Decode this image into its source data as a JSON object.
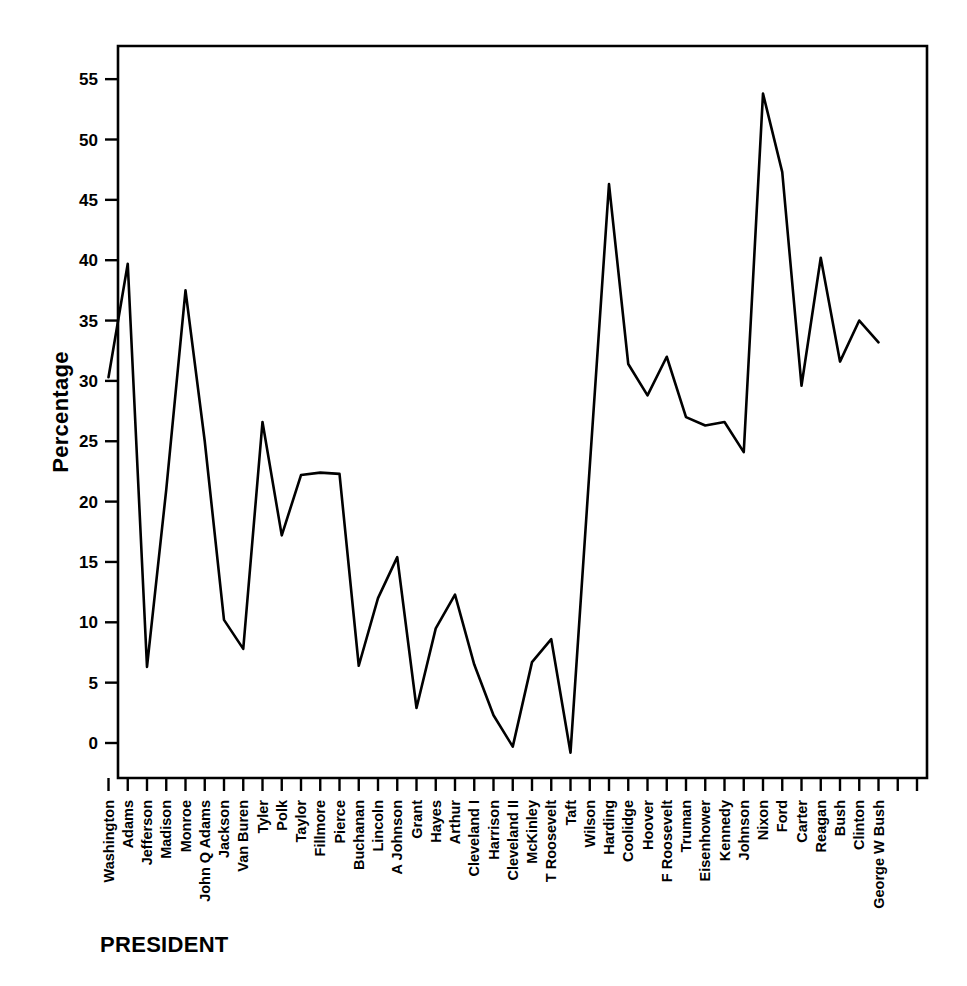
{
  "chart_data": {
    "type": "line",
    "title": "",
    "xlabel": "PRESIDENT",
    "ylabel": "Percentage",
    "ylim": [
      -3,
      58
    ],
    "yticks": [
      0,
      5,
      10,
      15,
      20,
      25,
      30,
      35,
      40,
      45,
      50,
      55
    ],
    "grid": false,
    "legend": "none",
    "line_color": "#000000",
    "categories": [
      "Washington",
      "Adams",
      "Jefferson",
      "Madison",
      "Monroe",
      "John Q Adams",
      "Jackson",
      "Van Buren",
      "Tyler",
      "Polk",
      "Taylor",
      "Fillmore",
      "Pierce",
      "Buchanan",
      "Lincoln",
      "A Johnson",
      "Grant",
      "Hayes",
      "Arthur",
      "Cleveland I",
      "Harrison",
      "Cleveland II",
      "McKinley",
      "T Roosevelt",
      "Taft",
      "Wilson",
      "Harding",
      "Coolidge",
      "Hoover",
      "F Roosevelt",
      "Truman",
      "Eisenhower",
      "Kennedy",
      "Johnson",
      "Nixon",
      "Ford",
      "Carter",
      "Reagan",
      "Bush",
      "Clinton",
      "George W Bush"
    ],
    "values": [
      30.3,
      39.7,
      6.3,
      21.0,
      37.5,
      25.0,
      10.2,
      7.8,
      26.6,
      17.2,
      22.2,
      22.4,
      22.3,
      6.4,
      12.0,
      15.4,
      2.9,
      9.5,
      12.3,
      6.5,
      2.3,
      -0.3,
      6.7,
      8.6,
      -0.8,
      22.9,
      46.3,
      31.4,
      28.8,
      32.0,
      27.0,
      26.3,
      26.6,
      24.1,
      53.8,
      47.3,
      29.6,
      40.2,
      31.6,
      35.0,
      33.2
    ],
    "point_count": 41,
    "tick_count": 43,
    "y_min_label": "0",
    "y_max_label": "55"
  }
}
